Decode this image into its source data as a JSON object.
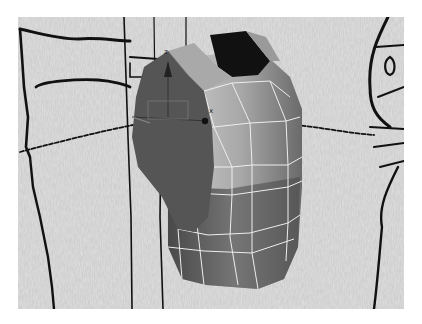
{
  "viewport": {
    "name": "3D perspective viewport",
    "background": "concept sketch reference plate (hand-drawn figure on textured paper)",
    "bg_color": "#d6d6d6"
  },
  "mesh": {
    "object": "torso / breastplate polygon mesh",
    "shading": "smooth grey with white wireframe edges",
    "selected_part": "left shoulder panel (dark)",
    "colors": {
      "light": "#c9c9c9",
      "mid": "#8f8f8f",
      "dark": "#555555",
      "hole": "#111111",
      "wire": "#ececec"
    }
  },
  "gizmo": {
    "z_label": "z",
    "x_label": "x",
    "type": "move/transform gizmo"
  }
}
